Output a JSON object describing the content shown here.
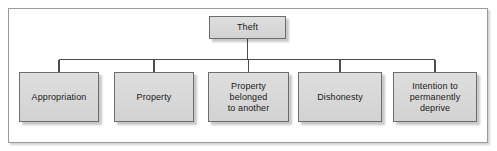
{
  "diagram": {
    "type": "tree",
    "colors": {
      "node_fill": "#d8d8d8",
      "node_border": "#6d6d6d",
      "frame_border": "#9a9a9a",
      "connector": "#4d4d4d",
      "text": "#1a1a1a",
      "background": "#ffffff"
    },
    "root": {
      "id": "theft",
      "label": "Theft"
    },
    "children": [
      {
        "id": "appropriation",
        "label": "Appropriation"
      },
      {
        "id": "property",
        "label": "Property"
      },
      {
        "id": "property-belonged-to-another",
        "label": "Property\nbelonged\nto another"
      },
      {
        "id": "dishonesty",
        "label": "Dishonesty"
      },
      {
        "id": "intention-to-permanently-deprive",
        "label": "Intention to\npermanently\ndeprive"
      }
    ],
    "connector_style": "orthogonal-bus"
  }
}
